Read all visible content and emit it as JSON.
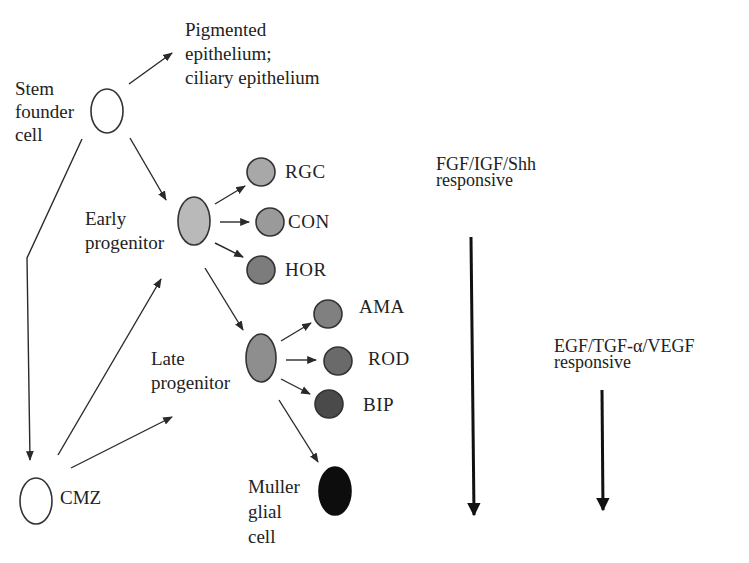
{
  "colors": {
    "line": "#2a2a2a",
    "outline": "#333333",
    "empty_cell": "#ffffff",
    "early_progenitor": "#b9b9b9",
    "late_progenitor": "#8e8e8e",
    "RGC": "#a8a8a8",
    "CON": "#9a9a9a",
    "HOR": "#7c7c7c",
    "AMA": "#808080",
    "ROD": "#6a6a6a",
    "BIP": "#4a4a4a",
    "muller": "#0d0d0d"
  },
  "labels": {
    "stem": [
      "Stem",
      "founder",
      "cell"
    ],
    "pigmented": [
      "Pigmented",
      "epithelium;",
      "ciliary epithelium"
    ],
    "early": [
      "Early",
      "progenitor"
    ],
    "late": [
      "Late",
      "progenitor"
    ],
    "cmz": "CMZ",
    "muller": [
      "Muller",
      "glial",
      "cell"
    ],
    "early_outputs": [
      "RGC",
      "CON",
      "HOR"
    ],
    "late_outputs": [
      "AMA",
      "ROD",
      "BIP"
    ]
  },
  "signals": [
    {
      "name": "FGF/IGF/Shh",
      "sub": "responsive"
    },
    {
      "name": "EGF/TGF-α/VEGF",
      "sub": "responsive"
    }
  ]
}
